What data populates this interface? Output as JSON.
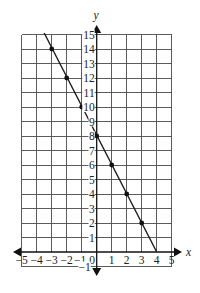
{
  "chart_data": {
    "type": "line",
    "title": "",
    "xlabel": "x",
    "ylabel": "y",
    "xlim": [
      -5,
      5
    ],
    "ylim": [
      -1,
      15
    ],
    "grid": true,
    "x_ticks": [
      -5,
      -4,
      -3,
      -2,
      -1,
      0,
      1,
      2,
      3,
      4,
      5
    ],
    "x_tick_labels": [
      "−5",
      "−4",
      "−3",
      "−2",
      "−1",
      "0",
      "1",
      "2",
      "3",
      "4",
      "5"
    ],
    "y_ticks": [
      -1,
      1,
      2,
      3,
      4,
      5,
      6,
      7,
      8,
      9,
      10,
      11,
      12,
      13,
      14,
      15
    ],
    "y_tick_labels": [
      "−1",
      "1",
      "2",
      "3",
      "4",
      "5",
      "6",
      "7",
      "8",
      "9",
      "10",
      "11",
      "12",
      "13",
      "14",
      "15"
    ],
    "axes_arrows": "both-ends",
    "series": [
      {
        "name": "line",
        "line_segment": {
          "x": [
            -3.5,
            4
          ],
          "y": [
            15,
            0
          ]
        },
        "points": {
          "x": [
            -3,
            -2,
            -1,
            0,
            1,
            2,
            3
          ],
          "y": [
            14,
            12,
            10,
            8,
            6,
            4,
            2
          ]
        },
        "color": "#1a1a1a"
      }
    ]
  }
}
